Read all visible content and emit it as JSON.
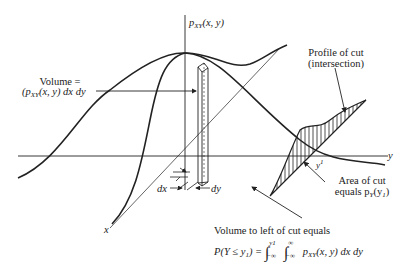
{
  "figure": {
    "axes": {
      "z_label": "p_XY(x, y)",
      "z_label_main": "p",
      "z_label_sub": "XY",
      "z_label_args": "(x, y)",
      "y_label": "y",
      "x_label": "x"
    },
    "volume_annotation": {
      "line1": "Volume =",
      "line2_p": "(p",
      "line2_sub": "XY",
      "line2_rest": "(x, y) dx dy"
    },
    "profile_annotation": {
      "line1": "Profile of cut",
      "line2": "(intersection)"
    },
    "cut_label": {
      "main": "y",
      "sup": "1"
    },
    "area_annotation": {
      "line1": "Area of cut",
      "line2_pre": "equals p",
      "line2_sub": "Y",
      "line2_arg_open": "(y",
      "line2_arg_sub": "1",
      "line2_arg_close": ")"
    },
    "differentials": {
      "dx": "dx",
      "dy": "dy"
    },
    "bottom_annotation": {
      "line1": "Volume to left of cut equals",
      "formula_lhs": "P(Y ≤ y",
      "formula_lhs_sub": "1",
      "formula_lhs_close": ") =",
      "integral1_upper": "y1",
      "integral1_lower": "−∞",
      "integral2_upper": "∞",
      "integral2_lower": "−∞",
      "integrand_p": "p",
      "integrand_sub": "XY",
      "integrand_rest": "(x, y) dx dy"
    },
    "colors": {
      "ink": "#222222",
      "background": "#ffffff"
    }
  }
}
